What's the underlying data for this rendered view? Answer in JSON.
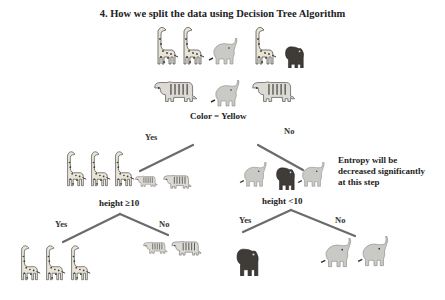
{
  "title": "4. How we split the data using Decision Tree Algorithm",
  "root": {
    "animals_row1": [
      "giraffe",
      "giraffe",
      "elephant",
      "giraffe",
      "bear"
    ],
    "animals_row2": [
      "tiger",
      "elephant",
      "tiger"
    ],
    "condition": "Color = Yellow"
  },
  "edges": {
    "root_yes": "Yes",
    "root_no": "No",
    "left_yes": "Yes",
    "left_no": "No",
    "right_yes": "Yes",
    "right_no": "No"
  },
  "left_node": {
    "animals": [
      "giraffe",
      "giraffe",
      "giraffe",
      "tiger",
      "tiger"
    ],
    "condition": "height ≥10"
  },
  "right_node": {
    "animals": [
      "elephant",
      "bear",
      "elephant"
    ],
    "condition": "height <10",
    "note_lines": [
      "Entropy will be",
      "decreased significantly",
      "at this step"
    ]
  },
  "leaves": {
    "left_yes": [
      "giraffe",
      "giraffe",
      "giraffe"
    ],
    "left_no": [
      "tiger",
      "tiger"
    ],
    "right_yes": [
      "bear"
    ],
    "right_no": [
      "elephant",
      "elephant"
    ]
  },
  "colors": {
    "line": "#6b6b6b",
    "giraffe_body": "#e9e4d6",
    "giraffe_spot": "#3c3a33",
    "elephant": "#c9c9c6",
    "bear": "#3f3b37",
    "tiger_body": "#dcdad3",
    "tiger_stripe": "#555"
  }
}
